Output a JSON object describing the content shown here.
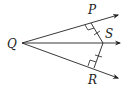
{
  "diagram": {
    "type": "geometry",
    "points": {
      "Q": {
        "label": "Q",
        "x": 22,
        "y": 43
      },
      "P": {
        "label": "P",
        "x": 91,
        "y": 23
      },
      "S": {
        "label": "S",
        "x": 103,
        "y": 43
      },
      "R": {
        "label": "R",
        "x": 94,
        "y": 68
      }
    },
    "rays": [
      {
        "from": "Q",
        "through": "P"
      },
      {
        "from": "Q",
        "through": "S"
      },
      {
        "from": "Q",
        "through": "R"
      }
    ],
    "segments": [
      {
        "from": "P",
        "to": "S",
        "tick_marks": 1
      },
      {
        "from": "R",
        "to": "S",
        "tick_marks": 1
      }
    ],
    "right_angles": [
      "P",
      "R"
    ],
    "colors": {
      "stroke": "#222222",
      "background": "#ffffff"
    }
  }
}
